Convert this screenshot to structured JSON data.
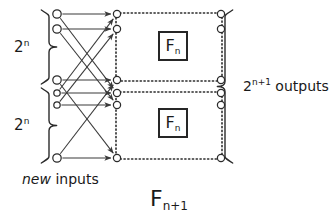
{
  "figure": {
    "width": 335,
    "height": 223,
    "background": "#ffffff",
    "ink": "#3a3a3a",
    "text_color": "#1a1a1a"
  },
  "labels": {
    "upper_group": {
      "base": "2",
      "exponent": "n"
    },
    "lower_group": {
      "base": "2",
      "exponent": "n"
    },
    "outputs": {
      "base": "2",
      "exponent": "n+1",
      "word": "outputs"
    },
    "new_inputs": {
      "emphasis": "new",
      "rest": " inputs"
    },
    "bottom_title": {
      "base": "F",
      "sub": "n+1"
    },
    "block_top": {
      "base": "F",
      "sub": "n"
    },
    "block_bottom": {
      "base": "F",
      "sub": "n"
    }
  },
  "geometry": {
    "columns": {
      "input_x": 57,
      "mid_x": 117,
      "output_x": 221
    },
    "input_nodes": [
      {
        "id": "i0",
        "y": 14,
        "r": 4.2
      },
      {
        "id": "i1",
        "y": 29,
        "r": 4.2
      },
      {
        "id": "i2",
        "y": 80,
        "r": 4.2
      },
      {
        "id": "i3",
        "y": 93,
        "r": 3.2
      },
      {
        "id": "i4",
        "y": 105,
        "r": 3.2
      },
      {
        "id": "i5",
        "y": 158,
        "r": 4.2
      }
    ],
    "mid_nodes": [
      {
        "id": "m0",
        "y": 14,
        "r": 3.6
      },
      {
        "id": "m1",
        "y": 29,
        "r": 3.6
      },
      {
        "id": "m2",
        "y": 80,
        "r": 3.6
      },
      {
        "id": "m3",
        "y": 93,
        "r": 3.6
      },
      {
        "id": "m4",
        "y": 105,
        "r": 3.6
      },
      {
        "id": "m5",
        "y": 158,
        "r": 3.6
      }
    ],
    "output_nodes": [
      {
        "id": "o0",
        "y": 14,
        "r": 3.6
      },
      {
        "id": "o1",
        "y": 29,
        "r": 3.6
      },
      {
        "id": "o2",
        "y": 80,
        "r": 3.6
      },
      {
        "id": "o3",
        "y": 93,
        "r": 3.6
      },
      {
        "id": "o4",
        "y": 105,
        "r": 3.6
      },
      {
        "id": "o5",
        "y": 158,
        "r": 3.6
      }
    ],
    "edges": [
      {
        "from": "i0",
        "to": "m0"
      },
      {
        "from": "i0",
        "to": "m3"
      },
      {
        "from": "i1",
        "to": "m1"
      },
      {
        "from": "i1",
        "to": "m4"
      },
      {
        "from": "i2",
        "to": "m2"
      },
      {
        "from": "i2",
        "to": "m5"
      },
      {
        "from": "i3",
        "to": "m3"
      },
      {
        "from": "i3",
        "to": "m0"
      },
      {
        "from": "i4",
        "to": "m4"
      },
      {
        "from": "i4",
        "to": "m1"
      },
      {
        "from": "i5",
        "to": "m5"
      },
      {
        "from": "i5",
        "to": "m2"
      }
    ],
    "dotted_boxes": [
      {
        "id": "box-top",
        "x": 116,
        "y": 13,
        "w": 106,
        "h": 68
      },
      {
        "id": "box-bottom",
        "x": 116,
        "y": 92,
        "w": 106,
        "h": 67
      }
    ],
    "f_boxes": [
      {
        "id": "fbox-top",
        "x": 158,
        "y": 31,
        "w": 30,
        "h": 30
      },
      {
        "id": "fbox-bottom",
        "x": 158,
        "y": 108,
        "w": 30,
        "h": 30
      }
    ],
    "braces": [
      {
        "id": "brace-upper-2n",
        "x": 40,
        "y0": 10,
        "y1": 84,
        "dir": "right"
      },
      {
        "id": "brace-lower-2n",
        "x": 40,
        "y0": 88,
        "y1": 163,
        "dir": "right"
      },
      {
        "id": "brace-outputs",
        "x": 234,
        "y0": 10,
        "y1": 163,
        "dir": "left"
      }
    ]
  }
}
